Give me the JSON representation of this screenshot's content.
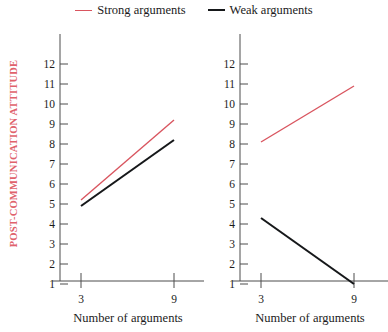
{
  "legend": {
    "entries": [
      {
        "label": "Strong arguments",
        "color": "#d9555f",
        "style": "thin"
      },
      {
        "label": "Weak arguments",
        "color": "#16181a",
        "style": "thick"
      }
    ]
  },
  "axes": {
    "y_title": "POST-COMMUNICATION ATTITUDE",
    "y_title_color": "#e0626c",
    "x_title": "Number of arguments",
    "y_ticks": [
      "12",
      "11",
      "10",
      "9",
      "8",
      "7",
      "6",
      "5",
      "4",
      "3",
      "2",
      "1"
    ],
    "x_ticks": [
      "3",
      "9"
    ]
  },
  "chart_data": {
    "type": "line",
    "title": "",
    "panels": [
      {
        "name": "left-panel",
        "xlabel": "Number of arguments",
        "ylabel": "POST-COMMUNICATION ATTITUDE",
        "x": [
          3,
          9
        ],
        "ylim": [
          0,
          12
        ],
        "xtick_labels": [
          "3",
          "9"
        ],
        "ytick_labels": [
          "1",
          "2",
          "3",
          "4",
          "5",
          "6",
          "7",
          "8",
          "9",
          "10",
          "11",
          "12"
        ],
        "grid": false,
        "series": [
          {
            "name": "Strong arguments",
            "color": "#d9555f",
            "values": [
              5.2,
              9.2
            ]
          },
          {
            "name": "Weak arguments",
            "color": "#16181a",
            "values": [
              4.9,
              8.2
            ]
          }
        ]
      },
      {
        "name": "right-panel",
        "xlabel": "Number of arguments",
        "ylabel": "",
        "x": [
          3,
          9
        ],
        "ylim": [
          0,
          12
        ],
        "xtick_labels": [
          "3",
          "9"
        ],
        "ytick_labels": [
          "1",
          "2",
          "3",
          "4",
          "5",
          "6",
          "7",
          "8",
          "9",
          "10",
          "11",
          "12"
        ],
        "grid": false,
        "series": [
          {
            "name": "Strong arguments",
            "color": "#d9555f",
            "values": [
              8.1,
              10.9
            ]
          },
          {
            "name": "Weak arguments",
            "color": "#16181a",
            "values": [
              4.3,
              1.0
            ]
          }
        ]
      }
    ],
    "legend_position": "top-center",
    "axis_color": "#4c4c4c"
  }
}
